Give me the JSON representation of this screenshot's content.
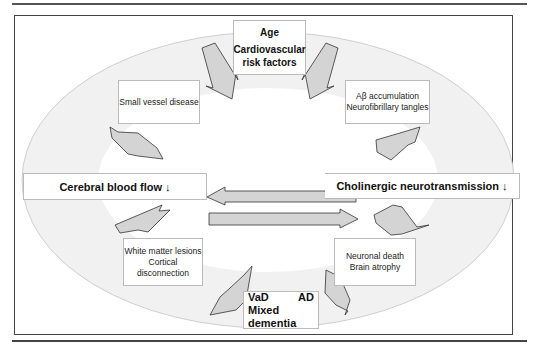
{
  "diagram": {
    "top": {
      "line1": "Age",
      "line2": "Cardiovascular",
      "line3": "risk factors"
    },
    "upper_left": {
      "text": "Small vessel disease"
    },
    "upper_right": {
      "line1": "Aβ accumulation",
      "line2": "Neurofibrillary tangles"
    },
    "middle_left": {
      "text": "Cerebral blood flow ↓"
    },
    "middle_right": {
      "text": "Cholinergic neurotransmission ↓"
    },
    "lower_left": {
      "line1": "White matter lesions",
      "line2": "Cortical disconnection"
    },
    "lower_right": {
      "line1": "Neuronal death",
      "line2": "Brain atrophy"
    },
    "bottom": {
      "left": "VaD",
      "right": "AD",
      "line2": "Mixed dementia"
    },
    "colors": {
      "arrow_fill": "#d4d4d4",
      "arrow_stroke": "#333333",
      "ellipse_fill": "#f0f0f0",
      "border": "#444444"
    }
  }
}
